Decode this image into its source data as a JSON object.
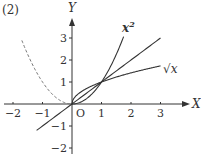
{
  "problem_label": "(2)",
  "axes": {
    "x_label": "X",
    "y_label": "Y",
    "origin_label": "O",
    "x_ticks": [
      {
        "value": -2,
        "label": "−2"
      },
      {
        "value": -1,
        "label": "−1"
      },
      {
        "value": 1,
        "label": "1"
      },
      {
        "value": 2,
        "label": "2"
      },
      {
        "value": 3,
        "label": "3"
      }
    ],
    "y_ticks": [
      {
        "value": 3,
        "label": "3"
      },
      {
        "value": 2,
        "label": "2"
      },
      {
        "value": 1,
        "label": "1"
      },
      {
        "value": -1,
        "label": "−1"
      },
      {
        "value": -2,
        "label": "−2"
      }
    ]
  },
  "curves": [
    {
      "name": "x-squared",
      "label": "x",
      "label_sup": "2",
      "style": "solid",
      "domain": [
        0,
        1.75
      ]
    },
    {
      "name": "identity-line",
      "label": "",
      "style": "solid",
      "domain": [
        -1.2,
        3.0
      ]
    },
    {
      "name": "sqrt-x",
      "label": "√x",
      "style": "solid",
      "domain": [
        0,
        3.0
      ]
    },
    {
      "name": "x-squared-left",
      "label": "",
      "style": "dashed",
      "domain": [
        -1.7,
        0
      ]
    }
  ],
  "colors": {
    "ink": "#333333",
    "dashed": "#777777"
  }
}
